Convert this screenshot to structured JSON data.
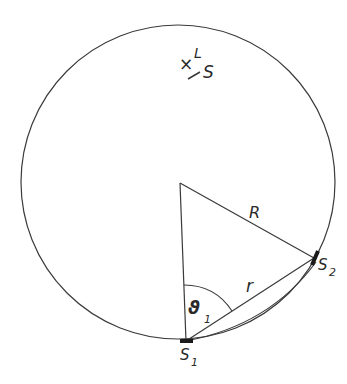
{
  "diagram": {
    "type": "geometry",
    "labels": {
      "top_marker": "×",
      "L": "L",
      "S": "S",
      "R": "R",
      "r": "r",
      "theta": "ϑ",
      "theta_sub": "1",
      "s1": "S",
      "s1_sub": "1",
      "s2": "S",
      "s2_sub": "2"
    },
    "colors": {
      "stroke": "#3a3a3a",
      "background": "#ffffff"
    }
  }
}
